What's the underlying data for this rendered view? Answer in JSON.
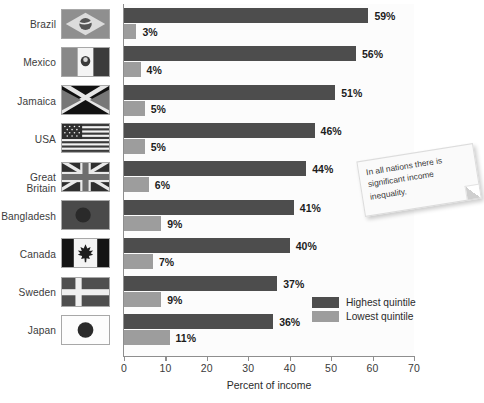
{
  "chart_data": {
    "type": "bar",
    "orientation": "horizontal",
    "title": "",
    "xlabel": "Percent of income",
    "ylabel": "",
    "xlim": [
      0,
      70
    ],
    "xticks": [
      0,
      10,
      20,
      30,
      40,
      50,
      60,
      70
    ],
    "grid": false,
    "legend_position": "inside-bottom-right",
    "categories": [
      "Brazil",
      "Mexico",
      "Jamaica",
      "USA",
      "Great Britain",
      "Bangladesh",
      "Canada",
      "Sweden",
      "Japan"
    ],
    "series": [
      {
        "name": "Highest quintile",
        "color": "#4d4d4d",
        "values": [
          59,
          56,
          51,
          46,
          44,
          41,
          40,
          37,
          36
        ],
        "labels": [
          "59%",
          "56%",
          "51%",
          "46%",
          "44%",
          "41%",
          "40%",
          "37%",
          "36%"
        ]
      },
      {
        "name": "Lowest quintile",
        "color": "#9d9d9d",
        "values": [
          3,
          4,
          5,
          5,
          6,
          9,
          7,
          9,
          11
        ],
        "labels": [
          "3%",
          "4%",
          "5%",
          "5%",
          "6%",
          "9%",
          "7%",
          "9%",
          "11%"
        ]
      }
    ],
    "annotations": [
      {
        "name": "sticky-note",
        "text": "In all nations there is significant income inequality."
      }
    ],
    "flag_icons": [
      "brazil-flag-icon",
      "mexico-flag-icon",
      "jamaica-flag-icon",
      "usa-flag-icon",
      "great-britain-flag-icon",
      "bangladesh-flag-icon",
      "canada-flag-icon",
      "sweden-flag-icon",
      "japan-flag-icon"
    ]
  },
  "axis": {
    "ticks": [
      "0",
      "10",
      "20",
      "30",
      "40",
      "50",
      "60",
      "70"
    ],
    "x_title": "Percent of income"
  },
  "legend": {
    "items": [
      {
        "label": "Highest quintile",
        "color": "#4d4d4d"
      },
      {
        "label": "Lowest quintile",
        "color": "#9d9d9d"
      }
    ]
  },
  "note": {
    "text": "In all nations there is significant income inequality."
  },
  "colors": {
    "highest": "#4d4d4d",
    "lowest": "#9d9d9d",
    "axis": "#8e8e8e",
    "plot_bg": "#fcfcfc"
  }
}
